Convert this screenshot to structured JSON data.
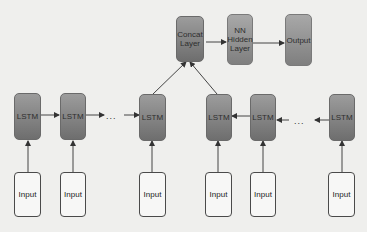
{
  "diagram": {
    "type": "bidirectional-lstm-architecture",
    "top_row": {
      "concat": "Concat Layer",
      "hidden": "NN Hidden Layer",
      "output": "Output"
    },
    "forward_lstm": [
      "LSTM",
      "LSTM",
      "LSTM"
    ],
    "backward_lstm": [
      "LSTM",
      "LSTM",
      "LSTM"
    ],
    "inputs": [
      "Input",
      "Input",
      "Input",
      "Input",
      "Input",
      "Input"
    ],
    "ellipsis": "...",
    "colors": {
      "background": "#efefed",
      "node_top": "#9c9c9c",
      "node_bottom": "#6e6e6e",
      "input_fill": "#f7f7f6",
      "line": "#333333"
    }
  }
}
